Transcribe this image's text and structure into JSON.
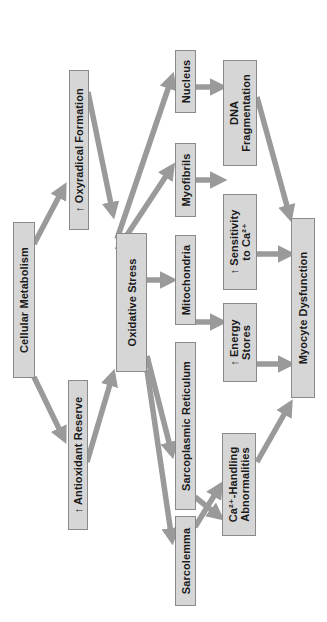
{
  "diagram": {
    "orientation": "rotated 90 degrees counter-clockwise",
    "colors": {
      "box_fill": "#d6d6d6",
      "box_border": "#8a8a8a",
      "arrow_fill": "#9a9a9a",
      "text": "#1a1a1a",
      "background": "#ffffff"
    },
    "nodes": {
      "cellular_metabolism": "Cellular Metabolism",
      "antioxidant_reserve": "↑ Antioxidant Reserve",
      "oxyradical_formation": "↑ Oxyradical Formation",
      "oxidative_stress": "Oxidative Stress",
      "sarcolemma": "Sarcolemma",
      "sarcoplasmic_reticulum": "Sarcoplasmic Reticulum",
      "mitochondria": "Mitochondria",
      "myofibrils": "Myofibrils",
      "nucleus": "Nucleus",
      "ca_handling": "Ca²⁺-Handling\nAbnormalities",
      "energy_stores": "↑ Energy\nStores",
      "sensitivity_ca": "↑ Sensitivity\nto Ca²⁺",
      "dna_fragmentation": "DNA\nFragmentation",
      "myocyte_dysfunction": "Myocyte Dysfunction"
    },
    "edges": [
      {
        "from": "Cellular Metabolism",
        "to": "↑ Antioxidant Reserve"
      },
      {
        "from": "Cellular Metabolism",
        "to": "↑ Oxyradical Formation"
      },
      {
        "from": "↑ Antioxidant Reserve",
        "to": "Oxidative Stress"
      },
      {
        "from": "↑ Oxyradical Formation",
        "to": "Oxidative Stress"
      },
      {
        "from": "Oxidative Stress",
        "to": "Sarcolemma"
      },
      {
        "from": "Oxidative Stress",
        "to": "Sarcoplasmic Reticulum"
      },
      {
        "from": "Oxidative Stress",
        "to": "Mitochondria"
      },
      {
        "from": "Oxidative Stress",
        "to": "Myofibrils"
      },
      {
        "from": "Oxidative Stress",
        "to": "Nucleus"
      },
      {
        "from": "Sarcolemma",
        "to": "Ca²⁺-Handling Abnormalities"
      },
      {
        "from": "Sarcoplasmic Reticulum",
        "to": "Ca²⁺-Handling Abnormalities"
      },
      {
        "from": "Mitochondria",
        "to": "↑ Energy Stores"
      },
      {
        "from": "Myofibrils",
        "to": "↑ Sensitivity to Ca²⁺"
      },
      {
        "from": "Nucleus",
        "to": "DNA Fragmentation"
      },
      {
        "from": "Ca²⁺-Handling Abnormalities",
        "to": "Myocyte Dysfunction"
      },
      {
        "from": "↑ Energy Stores",
        "to": "Myocyte Dysfunction"
      },
      {
        "from": "↑ Sensitivity to Ca²⁺",
        "to": "Myocyte Dysfunction"
      },
      {
        "from": "DNA Fragmentation",
        "to": "Myocyte Dysfunction"
      }
    ]
  }
}
